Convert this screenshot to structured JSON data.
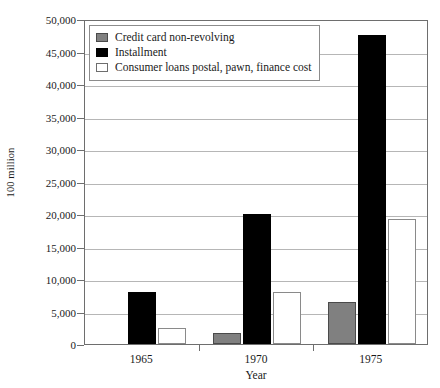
{
  "chart_data": {
    "type": "bar",
    "title": "",
    "xlabel": "Year",
    "ylabel": "100 million",
    "categories": [
      "1965",
      "1970",
      "1975"
    ],
    "series": [
      {
        "name": "Credit card non-revolving",
        "color": "#808080",
        "values": [
          0,
          1700,
          6500
        ]
      },
      {
        "name": "Installment",
        "color": "#000000",
        "values": [
          8000,
          20000,
          47500
        ]
      },
      {
        "name": "Consumer loans postal, pawn, finance cost",
        "color": "#ffffff",
        "values": [
          2500,
          8000,
          19300
        ]
      }
    ],
    "ylim": [
      0,
      50000
    ],
    "ytick_values": [
      0,
      5000,
      10000,
      15000,
      20000,
      25000,
      30000,
      35000,
      40000,
      45000,
      50000
    ],
    "ytick_labels": [
      "0",
      "5,000",
      "10,000",
      "15,000",
      "20,000",
      "25,000",
      "30,000",
      "35,000",
      "40,000",
      "45,000",
      "50,000"
    ],
    "grid": true,
    "legend_position": "top-left"
  }
}
